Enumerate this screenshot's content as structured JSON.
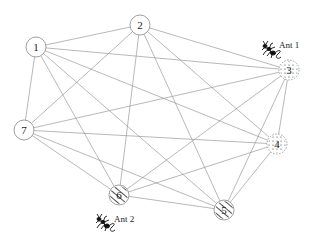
{
  "diagram": {
    "type": "complete-graph",
    "nodes": [
      {
        "id": "1",
        "label": "1",
        "x": 36,
        "y": 47,
        "style": "plain"
      },
      {
        "id": "2",
        "label": "2",
        "x": 140,
        "y": 25,
        "style": "plain"
      },
      {
        "id": "3",
        "label": "3",
        "x": 289,
        "y": 70,
        "style": "dotted"
      },
      {
        "id": "4",
        "label": "4",
        "x": 277,
        "y": 144,
        "style": "dotted"
      },
      {
        "id": "5",
        "label": "5",
        "x": 224,
        "y": 210,
        "style": "hatched"
      },
      {
        "id": "6",
        "label": "6",
        "x": 119,
        "y": 195,
        "style": "hatched"
      },
      {
        "id": "7",
        "label": "7",
        "x": 24,
        "y": 130,
        "style": "plain"
      }
    ],
    "edges": [
      [
        "1",
        "2"
      ],
      [
        "1",
        "3"
      ],
      [
        "1",
        "4"
      ],
      [
        "1",
        "5"
      ],
      [
        "1",
        "6"
      ],
      [
        "1",
        "7"
      ],
      [
        "2",
        "3"
      ],
      [
        "2",
        "4"
      ],
      [
        "2",
        "5"
      ],
      [
        "2",
        "6"
      ],
      [
        "2",
        "7"
      ],
      [
        "3",
        "4"
      ],
      [
        "3",
        "5"
      ],
      [
        "3",
        "6"
      ],
      [
        "3",
        "7"
      ],
      [
        "4",
        "5"
      ],
      [
        "4",
        "6"
      ],
      [
        "4",
        "7"
      ],
      [
        "5",
        "6"
      ],
      [
        "5",
        "7"
      ],
      [
        "6",
        "7"
      ]
    ],
    "ants": [
      {
        "label": "Ant 1",
        "at_node": "3",
        "icon_x": 262,
        "icon_y": 43,
        "text_x": 279,
        "text_y": 48
      },
      {
        "label": "Ant 2",
        "at_node": "6",
        "icon_x": 96,
        "icon_y": 216,
        "text_x": 114,
        "text_y": 222
      }
    ],
    "node_radius": 10,
    "edge_color": "#9a9a9a",
    "node_stroke": "#888888"
  }
}
